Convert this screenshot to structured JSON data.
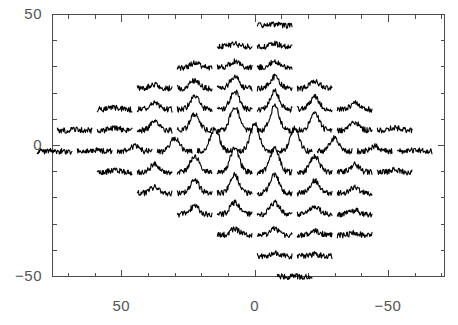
{
  "figure": {
    "kind": "spectral-line-map",
    "width": 458,
    "height": 325,
    "background_color": "#ffffff",
    "frame_color": "#4d4d4d",
    "data_color": "#000000",
    "tick_label_color": "#555555"
  },
  "axes": {
    "frame": {
      "left": 52,
      "top": 14,
      "right": 444,
      "bottom": 276
    },
    "x": {
      "label": "",
      "min": 76,
      "max": -71,
      "direction": "decreasing",
      "major_ticks": [
        50,
        0,
        -50
      ],
      "major_tick_labels": [
        "50",
        "0",
        "-50"
      ],
      "minor_tick_step": 10
    },
    "y": {
      "label": "",
      "min": -50,
      "max": 50,
      "direction": "increasing",
      "major_ticks": [
        50,
        0,
        -50
      ],
      "major_tick_labels": [
        "50",
        "0",
        "-50"
      ],
      "minor_tick_step": 10
    }
  },
  "chart_data": {
    "type": "line",
    "title": "",
    "xlabel": "",
    "ylabel": "",
    "xlim": [
      76,
      -71
    ],
    "ylim": [
      -50,
      50
    ],
    "grid": false,
    "legend": null,
    "cell": {
      "x_span": 13,
      "y_span": 11,
      "baseline_fraction": 0.72,
      "noise_amplitude": 0.1,
      "peak_width": 0.13,
      "samples": 64
    },
    "grid_spacing": {
      "dx": 15,
      "dy": 15,
      "row_offset": 7.5
    },
    "series": [
      {
        "name": "spectrum",
        "x": 60,
        "y": 0,
        "peak": 0.1
      },
      {
        "name": "spectrum",
        "x": 45,
        "y": 0,
        "peak": 0.12
      },
      {
        "name": "spectrum",
        "x": 30,
        "y": 0,
        "peak": 0.16
      },
      {
        "name": "spectrum",
        "x": 15,
        "y": 0,
        "peak": 0.3
      },
      {
        "name": "spectrum",
        "x": 0,
        "y": 0,
        "peak": 0.95
      },
      {
        "name": "spectrum",
        "x": -15,
        "y": 0,
        "peak": 0.6
      },
      {
        "name": "spectrum",
        "x": -30,
        "y": 0,
        "peak": 0.25
      },
      {
        "name": "spectrum",
        "x": -45,
        "y": 0,
        "peak": 0.12
      },
      {
        "name": "spectrum",
        "x": -60,
        "y": 0,
        "peak": 0.1
      }
    ]
  },
  "map_points": [
    [
      -7.5,
      48
    ],
    [
      7.5,
      40
    ],
    [
      -7.5,
      40
    ],
    [
      22.5,
      32
    ],
    [
      7.5,
      32
    ],
    [
      -7.5,
      32
    ],
    [
      37.5,
      24
    ],
    [
      22.5,
      24
    ],
    [
      7.5,
      24
    ],
    [
      -7.5,
      24
    ],
    [
      -22.5,
      24
    ],
    [
      52.5,
      16
    ],
    [
      37.5,
      16
    ],
    [
      22.5,
      16
    ],
    [
      7.5,
      16
    ],
    [
      -7.5,
      16
    ],
    [
      -22.5,
      16
    ],
    [
      -37.5,
      16
    ],
    [
      67.5,
      8
    ],
    [
      52.5,
      8
    ],
    [
      37.5,
      8
    ],
    [
      22.5,
      8
    ],
    [
      7.5,
      8
    ],
    [
      -7.5,
      8
    ],
    [
      -22.5,
      8
    ],
    [
      -37.5,
      8
    ],
    [
      -52.5,
      8
    ],
    [
      75,
      0
    ],
    [
      60,
      0
    ],
    [
      45,
      0
    ],
    [
      30,
      0
    ],
    [
      15,
      0
    ],
    [
      0,
      0
    ],
    [
      -15,
      0
    ],
    [
      -30,
      0
    ],
    [
      -45,
      0
    ],
    [
      -60,
      0
    ],
    [
      52.5,
      -8
    ],
    [
      37.5,
      -8
    ],
    [
      22.5,
      -8
    ],
    [
      7.5,
      -8
    ],
    [
      -7.5,
      -8
    ],
    [
      -22.5,
      -8
    ],
    [
      -37.5,
      -8
    ],
    [
      -52.5,
      -8
    ],
    [
      37.5,
      -16
    ],
    [
      22.5,
      -16
    ],
    [
      7.5,
      -16
    ],
    [
      -7.5,
      -16
    ],
    [
      -22.5,
      -16
    ],
    [
      -37.5,
      -16
    ],
    [
      22.5,
      -24
    ],
    [
      7.5,
      -24
    ],
    [
      -7.5,
      -24
    ],
    [
      -22.5,
      -24
    ],
    [
      -37.5,
      -24
    ],
    [
      7.5,
      -32
    ],
    [
      -7.5,
      -32
    ],
    [
      -22.5,
      -32
    ],
    [
      -37.5,
      -32
    ],
    [
      -7.5,
      -40
    ],
    [
      -22.5,
      -40
    ],
    [
      -15,
      -48
    ]
  ],
  "tick_labels": {
    "y_top": "50",
    "y_mid": "0",
    "y_bot": "−50",
    "x_left": "50",
    "x_mid": "0",
    "x_right": "−50"
  }
}
